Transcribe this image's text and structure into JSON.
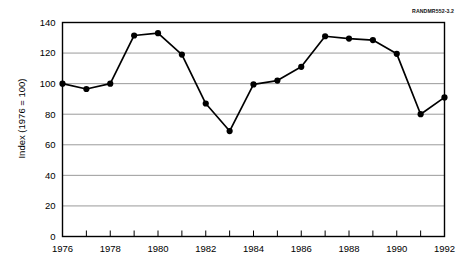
{
  "figure": {
    "id_label": "RANDMR552-3.2"
  },
  "chart_data": {
    "type": "line",
    "title": "",
    "subtitle": "",
    "xlabel": "",
    "ylabel": "Index (1976 = 100)",
    "xlim": [
      1976,
      1992
    ],
    "ylim": [
      0,
      140
    ],
    "ytick_labels": [
      "0",
      "20",
      "40",
      "60",
      "80",
      "100",
      "120",
      "140"
    ],
    "yticks": [
      0,
      20,
      40,
      60,
      80,
      100,
      120,
      140
    ],
    "xtick_labels": [
      "1976",
      "1978",
      "1980",
      "1982",
      "1984",
      "1986",
      "1988",
      "1990",
      "1992"
    ],
    "xticks": [
      1976,
      1978,
      1980,
      1982,
      1984,
      1986,
      1988,
      1990,
      1992
    ],
    "x_minor_ticks": [
      1976,
      1977,
      1978,
      1979,
      1980,
      1981,
      1982,
      1983,
      1984,
      1985,
      1986,
      1987,
      1988,
      1989,
      1990,
      1991,
      1992
    ],
    "grid": "horizontal",
    "legend": "none",
    "marker": "filled-circle",
    "line_color": "#000000",
    "grid_color": "#808080",
    "axis_color": "#000000",
    "x": [
      1976,
      1977,
      1978,
      1979,
      1980,
      1981,
      1982,
      1983,
      1984,
      1985,
      1986,
      1987,
      1988,
      1989,
      1990,
      1991,
      1992
    ],
    "values": [
      100,
      96.5,
      100,
      131.5,
      133,
      119,
      87,
      69,
      99.5,
      102,
      111,
      131,
      129.5,
      128.5,
      119.5,
      80,
      91
    ],
    "series": [
      {
        "name": "Index (1976 = 100)",
        "values": [
          100,
          96.5,
          100,
          131.5,
          133,
          119,
          87,
          69,
          99.5,
          102,
          111,
          131,
          129.5,
          128.5,
          119.5,
          80,
          91
        ]
      }
    ]
  }
}
